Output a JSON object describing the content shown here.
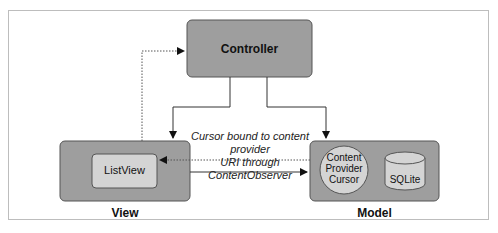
{
  "diagram": {
    "controller": {
      "label": "Controller"
    },
    "view": {
      "label": "View",
      "inner": {
        "label": "ListView"
      }
    },
    "model": {
      "label": "Model",
      "content_provider": {
        "label_lines": [
          "Content",
          "Provider",
          "Cursor"
        ]
      },
      "database": {
        "label": "SQLite"
      }
    },
    "annotation": {
      "lines": [
        "Cursor bound to content provider",
        "URI through ContentObserver"
      ]
    },
    "colors": {
      "box_dark": "#9e9e9e",
      "box_light": "#d4d4d4",
      "stroke": "#555555",
      "frame": "#bdbdbd"
    }
  }
}
